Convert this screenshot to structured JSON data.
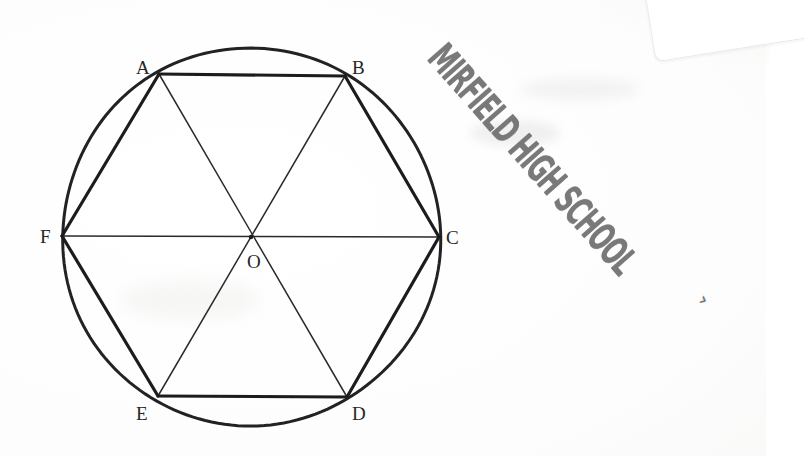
{
  "document": {
    "kind": "scanned-geometry-worksheet",
    "background_color": "#ffffff",
    "ink_color": "#1e1e1e",
    "stamp_color": "#6e6e6e"
  },
  "stamp": {
    "text": "MIRFIELD HIGH SCHOOL",
    "trailing_mark": "›",
    "rotation_degrees": 48.5
  },
  "figure": {
    "name": "regular-hexagon-inscribed-in-circle",
    "circle": {
      "center_label": "O",
      "cx": 251,
      "cy": 237,
      "r": 189
    },
    "vertices": [
      {
        "label": "A",
        "x": 159,
        "y": 74,
        "label_x": 136,
        "label_y": 58
      },
      {
        "label": "B",
        "x": 345,
        "y": 76,
        "label_x": 352,
        "label_y": 58
      },
      {
        "label": "C",
        "x": 439,
        "y": 237,
        "label_x": 446,
        "label_y": 228
      },
      {
        "label": "D",
        "x": 347,
        "y": 397,
        "label_x": 352,
        "label_y": 404
      },
      {
        "label": "E",
        "x": 158,
        "y": 396,
        "label_x": 136,
        "label_y": 404
      },
      {
        "label": "F",
        "x": 62,
        "y": 236,
        "label_x": 40,
        "label_y": 227
      }
    ],
    "center": {
      "label": "O",
      "x": 251,
      "y": 237,
      "label_x": 247,
      "label_y": 252
    },
    "hexagon_edges": [
      [
        "A",
        "B"
      ],
      [
        "B",
        "C"
      ],
      [
        "C",
        "D"
      ],
      [
        "D",
        "E"
      ],
      [
        "E",
        "F"
      ],
      [
        "F",
        "A"
      ]
    ],
    "diagonals": [
      [
        "A",
        "D"
      ],
      [
        "B",
        "E"
      ],
      [
        "C",
        "F"
      ]
    ],
    "stroke_widths": {
      "circle": 3.0,
      "hexagon_edge": 3.2,
      "diagonal": 1.5
    }
  }
}
